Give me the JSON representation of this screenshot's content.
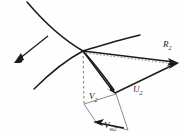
{
  "figure": {
    "background_color": "#fefefe",
    "stroke_color": "#1b1b1b",
    "dash_color": "#6e6e6e"
  },
  "labels": {
    "relative_velocity": {
      "symbol": "R",
      "subscript": "2",
      "x": 163,
      "y": 47
    },
    "blade_velocity": {
      "symbol": "U",
      "subscript": "2",
      "x": 133,
      "y": 92
    },
    "absolute_velocity": {
      "symbol": "V",
      "subscript": "2",
      "x": 90,
      "y": 98
    },
    "whirl_velocity": {
      "symbol": "V",
      "subscript": "w2",
      "x": 104,
      "y": 127
    }
  },
  "vectors": {
    "R2": {
      "name": "R2",
      "from": [
        83,
        51
      ],
      "to": [
        177,
        63
      ],
      "style": "solid",
      "arrow": true
    },
    "U2": {
      "name": "U2",
      "from": [
        115,
        93
      ],
      "to": [
        177,
        63
      ],
      "style": "solid",
      "arrow": true
    },
    "V2": {
      "name": "V2",
      "from": [
        83,
        51
      ],
      "to": [
        115,
        93
      ],
      "style": "solid",
      "arrow": true
    },
    "Vw2": {
      "name": "Vw2",
      "from": [
        125,
        128
      ],
      "to": [
        95,
        122
      ],
      "style": "solid",
      "arrow": true
    },
    "diagonal_construction": {
      "name": "construction",
      "from": [
        83,
        51
      ],
      "to": [
        177,
        63
      ],
      "style": "dotted",
      "arrow": false
    },
    "axial_reference": {
      "name": "axial-reference",
      "from": [
        83,
        51
      ],
      "to": [
        83,
        103
      ],
      "style": "dashed",
      "arrow": false
    },
    "flow_direction": {
      "name": "flow-direction",
      "from": [
        48,
        36
      ],
      "to": [
        15,
        62
      ],
      "style": "solid",
      "arrow": true
    }
  },
  "blades": {
    "upper_blade": "M 27 2 C 45 24, 66 40, 83 51 C 105 45, 125 39, 139 35",
    "lower_blade": "M 35 87 C 50 72, 68 60, 83 51 C 96 63, 106 76, 116 90"
  },
  "parallelogram": {
    "name": "whirl-component-parallelogram",
    "points": "83,103 115,93 127,129 95,122"
  }
}
